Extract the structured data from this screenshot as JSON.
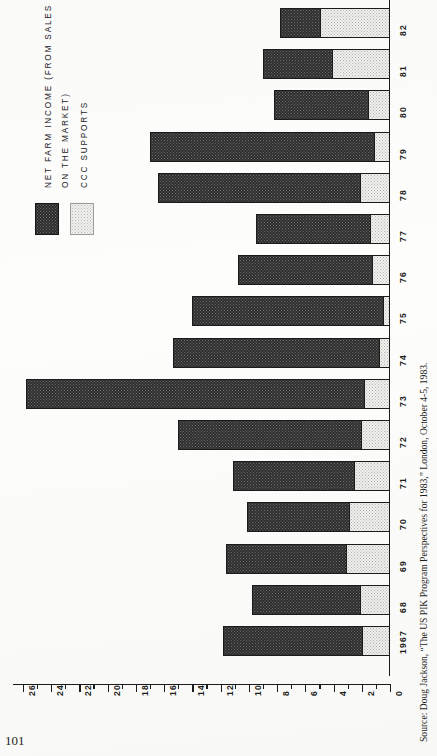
{
  "page": {
    "folio": "101",
    "source_note": "Source: Doug Jackson, “The US PIK Program Perspectives for 1983,” London, October 4-5, 1983.",
    "source_prefix": "Source:"
  },
  "legend": {
    "lines": [
      "NET  FARM  INCOME (FROM SALES",
      "ON  THE  MARKET)",
      "CCC  SUPPORTS"
    ],
    "swatch_dark_name": "net-farm-income-swatch",
    "swatch_light_name": "ccc-supports-swatch",
    "colors": {
      "dark": "#2e2e2e",
      "light": "#f2f2f0",
      "outline": "#1b1b1b"
    }
  },
  "chart_data": {
    "type": "bar",
    "orientation": "horizontal-stacked",
    "title": "",
    "xlabel": "BILLION  1967  DOLLARS",
    "ylabel": "",
    "grid": false,
    "legend_position": "top-left",
    "axis_title": "BILLION  1967  DOLLARS",
    "value_axis": {
      "min": 0,
      "max": 26,
      "tick_step": 2,
      "minor_step": 1,
      "ticks": [
        26,
        24,
        22,
        20,
        18,
        16,
        14,
        12,
        10,
        8,
        6,
        4,
        2,
        0
      ],
      "tick_labels": [
        "26",
        "24",
        "22",
        "20",
        "18",
        "16",
        "14",
        "12",
        "10",
        "8",
        "6",
        "4",
        "2",
        "0"
      ],
      "direction": "descending-left-to-right"
    },
    "categories": [
      "1967",
      "68",
      "69",
      "70",
      "71",
      "72",
      "73",
      "74",
      "75",
      "76",
      "77",
      "78",
      "79",
      "80",
      "81",
      "82"
    ],
    "series": [
      {
        "name": "NET FARM INCOME (FROM SALES ON THE MARKET)",
        "key": "net_farm_income",
        "fill": "dark-dotted",
        "values": [
          9.9,
          7.7,
          8.5,
          7.2,
          8.6,
          13.0,
          24.0,
          14.7,
          13.6,
          9.6,
          8.1,
          14.3,
          15.9,
          6.7,
          4.9,
          2.8
        ]
      },
      {
        "name": "CCC SUPPORTS",
        "key": "ccc_supports",
        "fill": "light-dotted",
        "values": [
          1.9,
          2.1,
          3.1,
          2.9,
          2.5,
          2.0,
          1.8,
          0.7,
          0.4,
          1.2,
          1.4,
          2.1,
          1.1,
          1.5,
          4.1,
          5.0
        ]
      }
    ],
    "totals": [
      11.8,
      9.8,
      11.6,
      10.1,
      11.1,
      15.0,
      25.8,
      15.4,
      14.0,
      10.8,
      9.5,
      16.4,
      17.0,
      8.2,
      9.0,
      7.8
    ]
  }
}
